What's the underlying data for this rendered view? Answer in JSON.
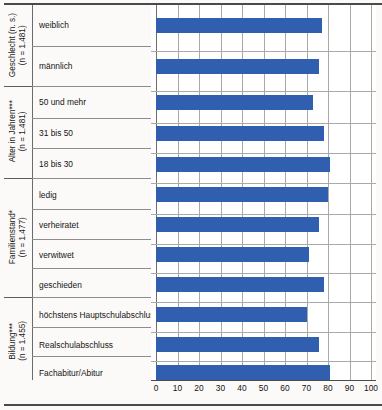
{
  "chart_data": {
    "type": "bar",
    "orientation": "horizontal",
    "title": "",
    "xlabel": "",
    "ylabel": "",
    "xlim": [
      0,
      100
    ],
    "xticks": [
      0,
      10,
      20,
      30,
      40,
      50,
      60,
      70,
      80,
      90,
      100
    ],
    "grid": true,
    "legend": "none",
    "bar_color": "#2f5fae",
    "groups": [
      {
        "label": "Geschlecht (n. s.)",
        "sublabel": "(n = 1.481)",
        "categories": [
          "weiblich",
          "männlich"
        ],
        "values": [
          77,
          76
        ]
      },
      {
        "label": "Alter in Jahren***",
        "sublabel": "(n = 1.481)",
        "categories": [
          "50 und mehr",
          "31 bis 50",
          "18 bis 30"
        ],
        "values": [
          73,
          78,
          81
        ]
      },
      {
        "label": "Familienstand*",
        "sublabel": "(n = 1.477)",
        "categories": [
          "ledig",
          "verheiratet",
          "verwitwet",
          "geschieden"
        ],
        "values": [
          80,
          76,
          71,
          78
        ]
      },
      {
        "label": "Bildung***",
        "sublabel": "(n = 1.455)",
        "categories": [
          "höchstens Hauptschulabschluss",
          "Realschulabschluss",
          "Fachabitur/Abitur"
        ],
        "values": [
          70,
          76,
          81
        ]
      }
    ],
    "categories": [
      "weiblich",
      "männlich",
      "50 und mehr",
      "31 bis 50",
      "18 bis 30",
      "ledig",
      "verheiratet",
      "verwitwet",
      "geschieden",
      "höchstens Hauptschulabschluss",
      "Realschulabschluss",
      "Fachabitur/Abitur"
    ],
    "values": [
      77,
      76,
      73,
      78,
      81,
      80,
      76,
      71,
      78,
      70,
      76,
      81
    ]
  },
  "axis": {
    "tick_0": "0",
    "tick_10": "10",
    "tick_20": "20",
    "tick_30": "30",
    "tick_40": "40",
    "tick_50": "50",
    "tick_60": "60",
    "tick_70": "70",
    "tick_80": "80",
    "tick_90": "90",
    "tick_100": "100"
  },
  "groups": {
    "geschlecht": {
      "label": "Geschlecht (n. s.)",
      "sublabel": "(n = 1.481)"
    },
    "alter": {
      "label": "Alter in Jahren***",
      "sublabel": "(n = 1.481)"
    },
    "familienstand": {
      "label": "Familienstand*",
      "sublabel": "(n = 1.477)"
    },
    "bildung": {
      "label": "Bildung***",
      "sublabel": "(n = 1.455)"
    }
  },
  "categories": {
    "c0": "weiblich",
    "c1": "männlich",
    "c2": "50 und mehr",
    "c3": "31 bis 50",
    "c4": "18 bis 30",
    "c5": "ledig",
    "c6": "verheiratet",
    "c7": "verwitwet",
    "c8": "geschieden",
    "c9": "höchstens Hauptschulabschluss",
    "c10": "Realschulabschluss",
    "c11": "Fachabitur/Abitur"
  }
}
